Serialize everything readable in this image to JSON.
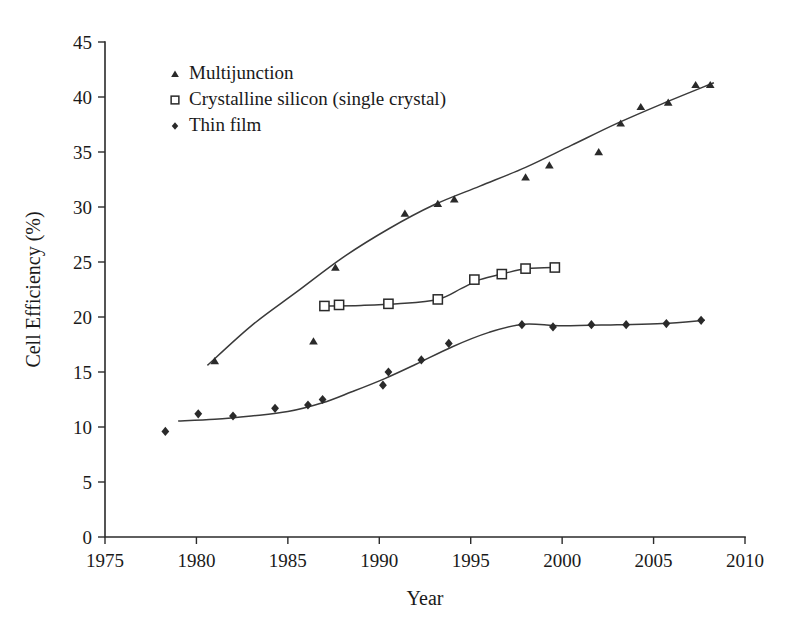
{
  "chart_data": {
    "type": "scatter",
    "title": "",
    "subtitle": "",
    "xlabel": "Year",
    "ylabel": "Cell Efficiency (%)",
    "xlim": [
      1975,
      2010
    ],
    "ylim": [
      0,
      45
    ],
    "xticks": [
      1975,
      1980,
      1985,
      1990,
      1995,
      2000,
      2005,
      2010
    ],
    "yticks": [
      0,
      5,
      10,
      15,
      20,
      25,
      30,
      35,
      40,
      45
    ],
    "grid": false,
    "legend_position": "top-left",
    "annotations": [],
    "series": [
      {
        "name": "Multijunction",
        "marker": "triangle",
        "marker_style": "filled",
        "color": "#2a2a2a",
        "trend_line": true,
        "points": [
          {
            "x": 1981.0,
            "y": 16.0
          },
          {
            "x": 1986.4,
            "y": 17.8
          },
          {
            "x": 1987.6,
            "y": 24.5
          },
          {
            "x": 1991.4,
            "y": 29.4
          },
          {
            "x": 1993.2,
            "y": 30.3
          },
          {
            "x": 1994.1,
            "y": 30.7
          },
          {
            "x": 1998.0,
            "y": 32.7
          },
          {
            "x": 1999.3,
            "y": 33.8
          },
          {
            "x": 2002.0,
            "y": 35.0
          },
          {
            "x": 2003.2,
            "y": 37.6
          },
          {
            "x": 2004.3,
            "y": 39.1
          },
          {
            "x": 2005.8,
            "y": 39.5
          },
          {
            "x": 2007.3,
            "y": 41.1
          },
          {
            "x": 2008.1,
            "y": 41.1
          }
        ]
      },
      {
        "name": "Crystalline silicon (single crystal)",
        "marker": "square",
        "marker_style": "open",
        "color": "#2a2a2a",
        "trend_line": true,
        "points": [
          {
            "x": 1987.0,
            "y": 21.0
          },
          {
            "x": 1987.8,
            "y": 21.1
          },
          {
            "x": 1990.5,
            "y": 21.2
          },
          {
            "x": 1993.2,
            "y": 21.6
          },
          {
            "x": 1995.2,
            "y": 23.4
          },
          {
            "x": 1996.7,
            "y": 23.9
          },
          {
            "x": 1998.0,
            "y": 24.4
          },
          {
            "x": 1999.6,
            "y": 24.5
          }
        ]
      },
      {
        "name": "Thin film",
        "marker": "diamond",
        "marker_style": "filled",
        "color": "#2a2a2a",
        "trend_line": true,
        "points": [
          {
            "x": 1978.3,
            "y": 9.6
          },
          {
            "x": 1980.1,
            "y": 11.2
          },
          {
            "x": 1982.0,
            "y": 11.0
          },
          {
            "x": 1984.3,
            "y": 11.7
          },
          {
            "x": 1986.1,
            "y": 12.0
          },
          {
            "x": 1986.9,
            "y": 12.5
          },
          {
            "x": 1990.2,
            "y": 13.8
          },
          {
            "x": 1990.5,
            "y": 15.0
          },
          {
            "x": 1992.3,
            "y": 16.1
          },
          {
            "x": 1993.8,
            "y": 17.6
          },
          {
            "x": 1997.8,
            "y": 19.3
          },
          {
            "x": 1999.5,
            "y": 19.1
          },
          {
            "x": 2001.6,
            "y": 19.3
          },
          {
            "x": 2003.5,
            "y": 19.3
          },
          {
            "x": 2005.7,
            "y": 19.4
          },
          {
            "x": 2007.6,
            "y": 19.7
          }
        ]
      }
    ],
    "legend": [
      {
        "label": "Multijunction",
        "marker": "triangle",
        "marker_style": "filled"
      },
      {
        "label": "Crystalline silicon (single crystal)",
        "marker": "square",
        "marker_style": "open"
      },
      {
        "label": "Thin film",
        "marker": "diamond",
        "marker_style": "filled"
      }
    ]
  }
}
